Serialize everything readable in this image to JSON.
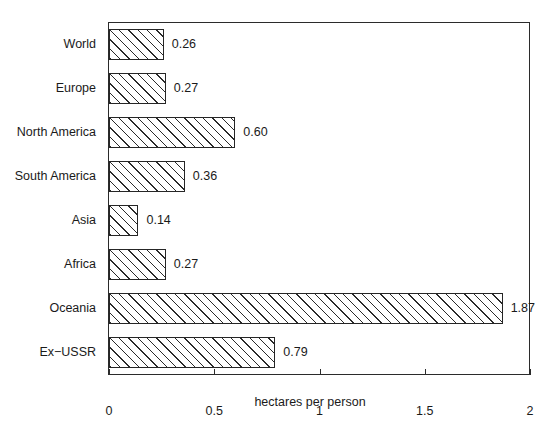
{
  "chart_data": {
    "type": "bar",
    "orientation": "horizontal",
    "title": "",
    "subtitle": "",
    "xlabel": "hectares per person",
    "ylabel": "",
    "categories": [
      "World",
      "Europe",
      "North America",
      "South America",
      "Asia",
      "Africa",
      "Oceania",
      "Ex−USSR"
    ],
    "values": [
      0.26,
      0.27,
      0.6,
      0.36,
      0.14,
      0.27,
      1.87,
      0.79
    ],
    "value_labels": [
      "0.26",
      "0.27",
      "0.60",
      "0.36",
      "0.14",
      "0.27",
      "1.87",
      "0.79"
    ],
    "xlim": [
      0,
      2
    ],
    "ylim": null,
    "xticks": [
      0,
      0.5,
      1,
      1.5,
      2
    ],
    "xtick_labels": [
      "0",
      "0.5",
      "1",
      "1.5",
      "2"
    ],
    "grid": false,
    "legend": null,
    "bar_fill": "diagonal-hatch",
    "bar_edge_color": "#262626",
    "background_color": "#ffffff",
    "frame": true
  },
  "axis": {
    "x_title": "hectares per person"
  }
}
